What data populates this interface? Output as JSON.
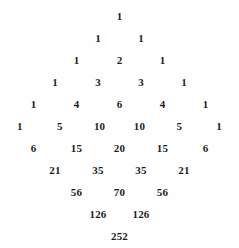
{
  "figure": {
    "name": "pascal-triangle",
    "background_color": "#fefefe",
    "text_color": "#1c1c1c",
    "row_height_px": 22,
    "column_spacing_px": 43,
    "first_row_top_px": 8
  },
  "chart_data": {
    "type": "table",
    "title": "",
    "subtitle": "",
    "xlabel": "",
    "ylabel": "",
    "grid": false,
    "legend": null,
    "rows": [
      {
        "index": 1,
        "values": [
          "1"
        ]
      },
      {
        "index": 2,
        "values": [
          "1",
          "1"
        ]
      },
      {
        "index": 3,
        "values": [
          "1",
          "2",
          "1"
        ]
      },
      {
        "index": 4,
        "values": [
          "1",
          "3",
          "3",
          "1"
        ]
      },
      {
        "index": 5,
        "values": [
          "1",
          "4",
          "6",
          "4",
          "1"
        ]
      },
      {
        "index": 6,
        "values": [
          "1",
          "5",
          "10",
          "10",
          "5",
          "1"
        ]
      },
      {
        "index": 7,
        "values": [
          "6",
          "15",
          "20",
          "15",
          "6"
        ]
      },
      {
        "index": 8,
        "values": [
          "21",
          "35",
          "35",
          "21"
        ]
      },
      {
        "index": 9,
        "values": [
          "56",
          "70",
          "56"
        ]
      },
      {
        "index": 10,
        "values": [
          "126",
          "126"
        ]
      },
      {
        "index": 11,
        "values": [
          "252"
        ]
      }
    ],
    "center_column_values": [
      "1",
      "2",
      "6",
      "20",
      "70",
      "252"
    ],
    "row_tops_px": [
      8,
      30,
      52,
      74,
      96,
      118,
      140,
      162,
      184,
      206,
      228
    ]
  }
}
